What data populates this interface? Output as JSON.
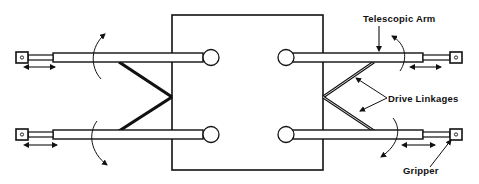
{
  "diagram": {
    "type": "mechanical-schematic",
    "colors": {
      "stroke": "#111111",
      "background": "#ffffff"
    },
    "labels": {
      "telescopic_arm": "Telescopic Arm",
      "drive_linkages": "Drive Linkages",
      "gripper": "Gripper"
    },
    "components": {
      "central_body": "rectangular base",
      "arms": [
        {
          "id": "upper-left",
          "side": "left",
          "position": "upper"
        },
        {
          "id": "lower-left",
          "side": "left",
          "position": "lower"
        },
        {
          "id": "upper-right",
          "side": "right",
          "position": "upper"
        },
        {
          "id": "lower-right",
          "side": "right",
          "position": "lower"
        }
      ],
      "pivot_joints": 4,
      "grippers": 4,
      "drive_linkage_pairs": 2,
      "motion_indicators": {
        "rotation_arrows": 4,
        "extension_arrows": 4
      }
    }
  }
}
